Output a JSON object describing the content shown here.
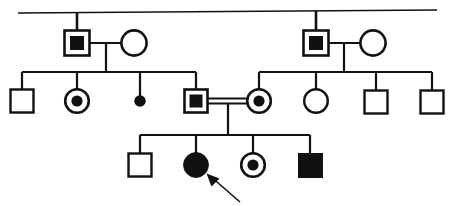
{
  "chart": {
    "type": "pedigree-diagram",
    "width": 453,
    "height": 206,
    "background_color": "#ffffff",
    "stroke_color": "#111111"
  },
  "legend": {
    "square_meaning": "male",
    "circle_meaning": "female",
    "open_meaning": "unaffected",
    "filled_meaning": "affected",
    "dot_inside_meaning": "carrier / heterozygote",
    "small_filled_dot_meaning": "stillbirth or miscarriage",
    "double_line_meaning": "consanguineous mating",
    "arrow_meaning": "proband"
  },
  "generations": [
    {
      "id": "I",
      "label": "I",
      "members": [
        {
          "id": "I-1",
          "name": "generation-i-male-left",
          "sex": "male",
          "shape": "square",
          "status": "carrier",
          "fill": "open-with-filled-square",
          "x": 77,
          "y": 43,
          "size": 25
        },
        {
          "id": "I-2",
          "name": "generation-i-female-left",
          "sex": "female",
          "shape": "circle",
          "status": "unaffected",
          "fill": "open",
          "x": 133,
          "y": 43,
          "size": 25
        },
        {
          "id": "I-3",
          "name": "generation-i-male-right",
          "sex": "male",
          "shape": "square",
          "status": "carrier",
          "fill": "open-with-filled-square",
          "x": 316,
          "y": 43,
          "size": 25
        },
        {
          "id": "I-4",
          "name": "generation-i-female-right",
          "sex": "female",
          "shape": "circle",
          "status": "unaffected",
          "fill": "open",
          "x": 372,
          "y": 43,
          "size": 25
        }
      ]
    },
    {
      "id": "II",
      "label": "II",
      "members": [
        {
          "id": "II-1",
          "name": "generation-ii-male-unaffected-1",
          "sex": "male",
          "shape": "square",
          "status": "unaffected",
          "fill": "open",
          "x": 22,
          "y": 101,
          "size": 24
        },
        {
          "id": "II-2",
          "name": "generation-ii-female-carrier-1",
          "sex": "female",
          "shape": "circle",
          "status": "carrier",
          "fill": "open-with-dot",
          "x": 77,
          "y": 101,
          "size": 24
        },
        {
          "id": "II-3",
          "name": "generation-ii-stillbirth",
          "sex": "unknown",
          "shape": "small-dot",
          "status": "stillbirth",
          "fill": "filled",
          "x": 140,
          "y": 101,
          "size": 11
        },
        {
          "id": "II-4",
          "name": "generation-ii-male-carrier",
          "sex": "male",
          "shape": "square",
          "status": "carrier",
          "fill": "open-with-filled-square",
          "x": 196,
          "y": 101,
          "size": 24
        },
        {
          "id": "II-5",
          "name": "generation-ii-female-carrier-2",
          "sex": "female",
          "shape": "circle",
          "status": "carrier",
          "fill": "open-with-dot",
          "x": 259,
          "y": 101,
          "size": 24
        },
        {
          "id": "II-6",
          "name": "generation-ii-female-unaffected",
          "sex": "female",
          "shape": "circle",
          "status": "unaffected",
          "fill": "open",
          "x": 316,
          "y": 101,
          "size": 24
        },
        {
          "id": "II-7",
          "name": "generation-ii-male-unaffected-2",
          "sex": "male",
          "shape": "square",
          "status": "unaffected",
          "fill": "open",
          "x": 376,
          "y": 101,
          "size": 24
        },
        {
          "id": "II-8",
          "name": "generation-ii-male-unaffected-3",
          "sex": "male",
          "shape": "square",
          "status": "unaffected",
          "fill": "open",
          "x": 432,
          "y": 101,
          "size": 24
        }
      ]
    },
    {
      "id": "III",
      "label": "III",
      "members": [
        {
          "id": "III-1",
          "name": "generation-iii-male-unaffected",
          "sex": "male",
          "shape": "square",
          "status": "unaffected",
          "fill": "open",
          "x": 140,
          "y": 165,
          "size": 24
        },
        {
          "id": "III-2",
          "name": "generation-iii-female-affected-proband",
          "sex": "female",
          "shape": "circle",
          "status": "affected",
          "fill": "filled",
          "is_proband": true,
          "x": 196,
          "y": 165,
          "size": 24
        },
        {
          "id": "III-3",
          "name": "generation-iii-female-carrier",
          "sex": "female",
          "shape": "circle",
          "status": "carrier",
          "fill": "open-with-dot",
          "x": 253,
          "y": 165,
          "size": 24
        },
        {
          "id": "III-4",
          "name": "generation-iii-male-affected",
          "sex": "male",
          "shape": "square",
          "status": "affected",
          "fill": "filled",
          "x": 310,
          "y": 165,
          "size": 24
        }
      ]
    }
  ],
  "matings": [
    {
      "id": "mating-I-left",
      "name": "mating-line-generation-i-left",
      "partners": [
        "I-1",
        "I-2"
      ],
      "consanguineous": false,
      "y": 43,
      "x1": 90,
      "x2": 121,
      "descent_x": 106,
      "descent_y2": 72
    },
    {
      "id": "mating-I-right",
      "name": "mating-line-generation-i-right",
      "partners": [
        "I-3",
        "I-4"
      ],
      "consanguineous": false,
      "y": 43,
      "x1": 329,
      "x2": 360,
      "descent_x": 344,
      "descent_y2": 72
    },
    {
      "id": "mating-II-consanguineous",
      "name": "mating-line-consanguineous",
      "partners": [
        "II-4",
        "II-5"
      ],
      "consanguineous": true,
      "y": 101,
      "x1": 209,
      "x2": 247,
      "descent_x": 228,
      "descent_y2": 135
    }
  ],
  "sibship_bars": [
    {
      "id": "sibship-II-left",
      "name": "sibship-bar-generation-ii-left",
      "y": 72,
      "x1": 22,
      "x2": 196,
      "children": [
        "II-1",
        "II-2",
        "II-3",
        "II-4"
      ]
    },
    {
      "id": "sibship-II-right",
      "name": "sibship-bar-generation-ii-right",
      "y": 72,
      "x1": 259,
      "x2": 432,
      "children": [
        "II-5",
        "II-6",
        "II-7",
        "II-8"
      ]
    },
    {
      "id": "sibship-III",
      "name": "sibship-bar-generation-iii",
      "y": 135,
      "x1": 140,
      "x2": 310,
      "children": [
        "III-1",
        "III-2",
        "III-3",
        "III-4"
      ]
    }
  ],
  "top_line": {
    "name": "founder-connector-line",
    "y": 12,
    "x1": 18,
    "x2": 437,
    "drop_lines": [
      {
        "name": "founder-drop-left",
        "x": 77,
        "y1": 12,
        "y2": 31
      },
      {
        "name": "founder-drop-right",
        "x": 316,
        "y1": 12,
        "y2": 31
      }
    ]
  },
  "proband_arrow": {
    "name": "proband-arrow",
    "target": "III-2",
    "tail_x": 240,
    "tail_y": 202,
    "tip_x": 209,
    "tip_y": 175
  }
}
